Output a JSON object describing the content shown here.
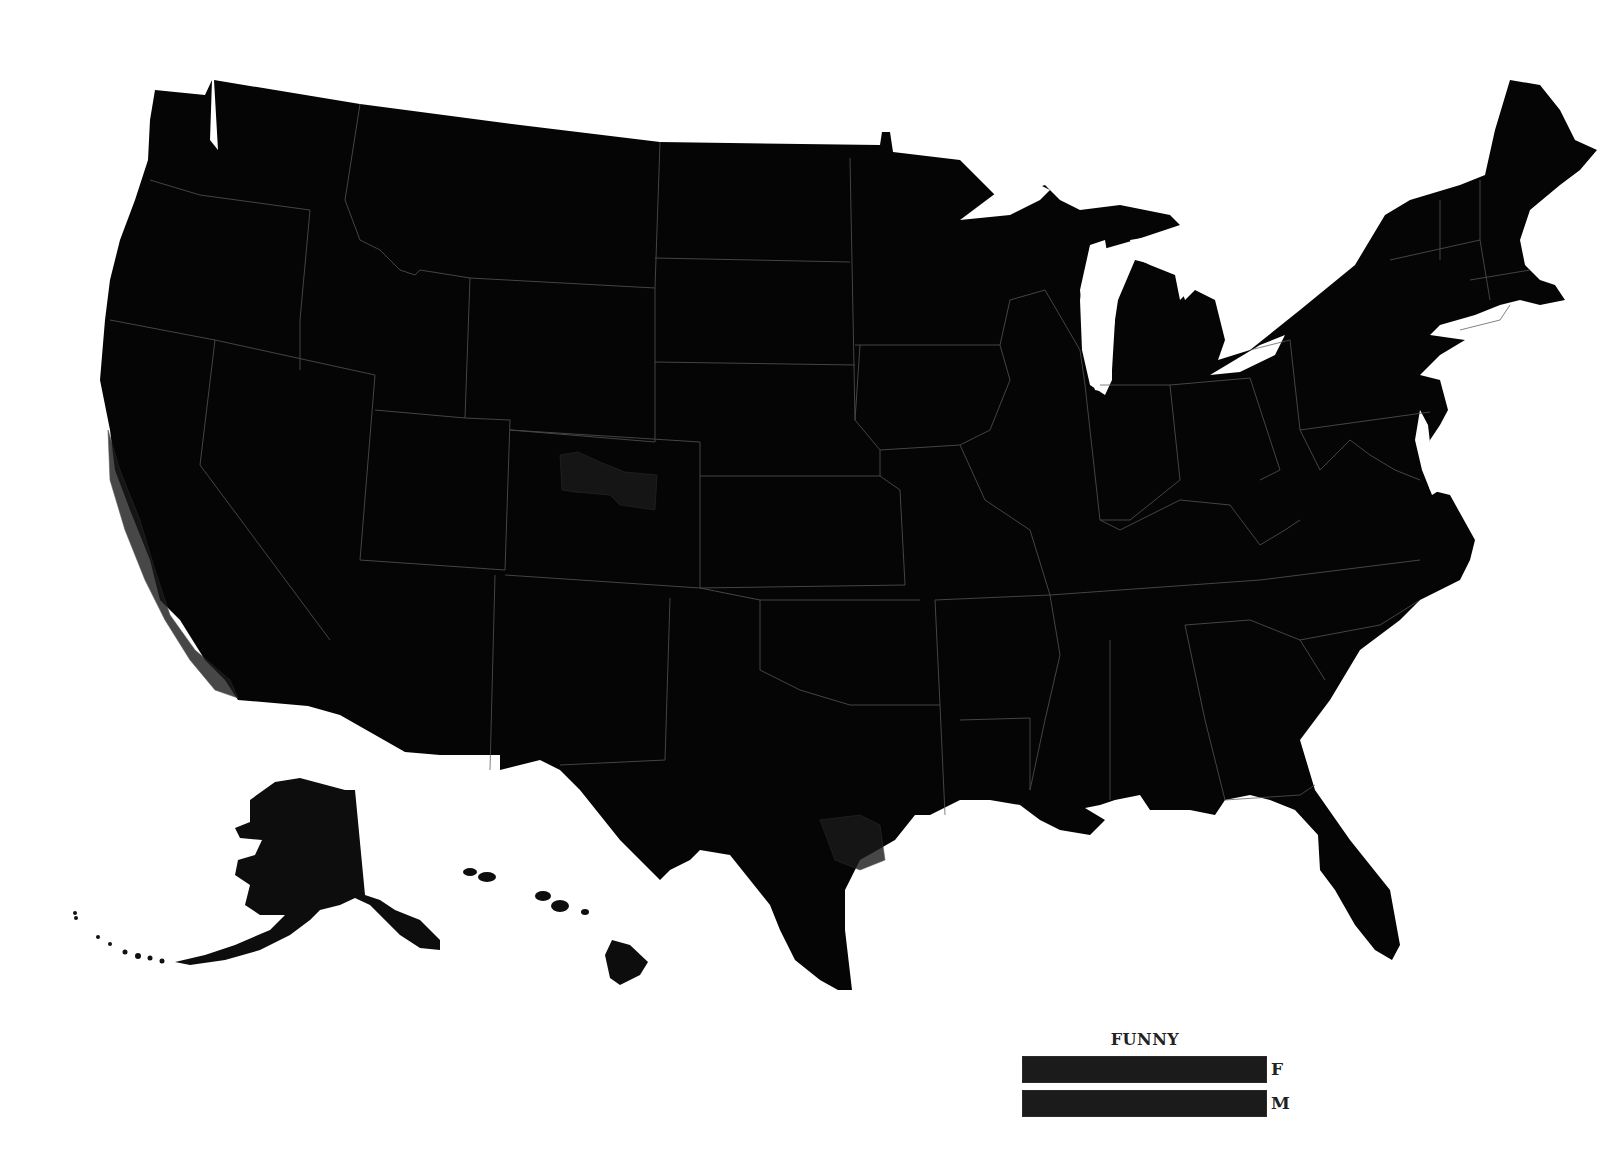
{
  "map": {
    "subject": "United States choropleth (counties)",
    "background_color": "#ffffff",
    "land_color": "#050505",
    "border_color": "#5a5a5a",
    "regions_shown": [
      "Contiguous United States",
      "Alaska",
      "Hawaii"
    ]
  },
  "legend": {
    "title": "FUNNY",
    "items": [
      {
        "label": "F",
        "color": "#1b1b1b"
      },
      {
        "label": "M",
        "color": "#1b1b1b"
      }
    ]
  }
}
